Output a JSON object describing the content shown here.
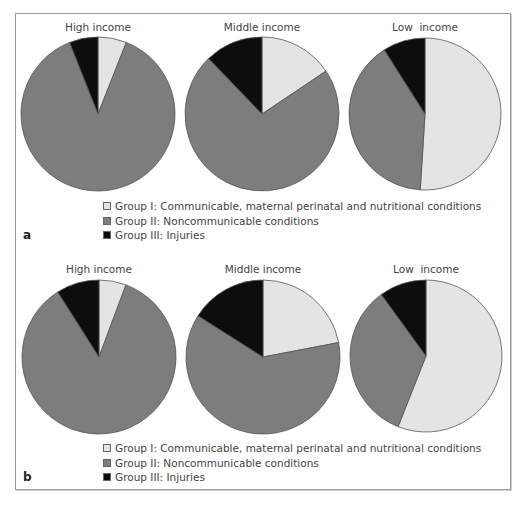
{
  "colors": {
    "group1": "#e4e4e4",
    "group2": "#7d7d7d",
    "group3": "#0d0d0d",
    "stroke": "#555555"
  },
  "panels": [
    {
      "label": "a",
      "pies": [
        {
          "title": "High income",
          "values": [
            6,
            88,
            6
          ]
        },
        {
          "title": "Middle income",
          "values": [
            15.6,
            72.2,
            12.2
          ]
        },
        {
          "title": "Low  income",
          "values": [
            51,
            40,
            9
          ]
        }
      ],
      "legend": [
        "Group I: Communicable, maternal perinatal and nutritional conditions",
        "Group II: Noncommunicable conditions",
        "Group III: Injuries"
      ]
    },
    {
      "label": "b",
      "pies": [
        {
          "title": "High income",
          "values": [
            5.7,
            85.3,
            9
          ]
        },
        {
          "title": "Middle income",
          "values": [
            22,
            62,
            16
          ]
        },
        {
          "title": "Low  income",
          "values": [
            56,
            34,
            10
          ]
        }
      ],
      "legend": [
        "Group I: Communicable, maternal perinatal and nutritional conditions",
        "Group II: Noncommunicable conditions",
        "Group III: Injuries"
      ]
    }
  ],
  "chart_data": [
    {
      "type": "pie",
      "panel": "a",
      "title": "High income",
      "categories": [
        "Group I: Communicable, maternal perinatal and nutritional conditions",
        "Group II: Noncommunicable conditions",
        "Group III: Injuries"
      ],
      "values": [
        6,
        88,
        6
      ],
      "legend_position": "bottom"
    },
    {
      "type": "pie",
      "panel": "a",
      "title": "Middle income",
      "categories": [
        "Group I: Communicable, maternal perinatal and nutritional conditions",
        "Group II: Noncommunicable conditions",
        "Group III: Injuries"
      ],
      "values": [
        15.6,
        72.2,
        12.2
      ],
      "legend_position": "bottom"
    },
    {
      "type": "pie",
      "panel": "a",
      "title": "Low income",
      "categories": [
        "Group I: Communicable, maternal perinatal and nutritional conditions",
        "Group II: Noncommunicable conditions",
        "Group III: Injuries"
      ],
      "values": [
        51,
        40,
        9
      ],
      "legend_position": "bottom"
    },
    {
      "type": "pie",
      "panel": "b",
      "title": "High income",
      "categories": [
        "Group I: Communicable, maternal perinatal and nutritional conditions",
        "Group II: Noncommunicable conditions",
        "Group III: Injuries"
      ],
      "values": [
        5.7,
        85.3,
        9
      ],
      "legend_position": "bottom"
    },
    {
      "type": "pie",
      "panel": "b",
      "title": "Middle income",
      "categories": [
        "Group I: Communicable, maternal perinatal and nutritional conditions",
        "Group II: Noncommunicable conditions",
        "Group III: Injuries"
      ],
      "values": [
        22,
        62,
        16
      ],
      "legend_position": "bottom"
    },
    {
      "type": "pie",
      "panel": "b",
      "title": "Low income",
      "categories": [
        "Group I: Communicable, maternal perinatal and nutritional conditions",
        "Group II: Noncommunicable conditions",
        "Group III: Injuries"
      ],
      "values": [
        56,
        34,
        10
      ],
      "legend_position": "bottom"
    }
  ]
}
